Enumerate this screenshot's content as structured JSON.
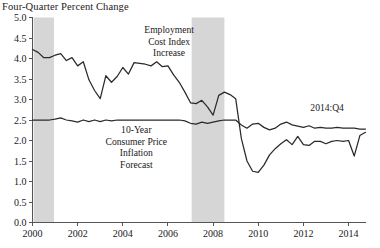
{
  "chart_data": {
    "type": "line",
    "title": "Four-Quarter Percent Change",
    "xlabel": "",
    "ylabel": "",
    "xlim": [
      2000.0,
      2014.75
    ],
    "ylim": [
      0.0,
      5.0
    ],
    "grid": false,
    "legend_position": "inline-annotations",
    "y_ticks": [
      "0.0",
      "0.5",
      "1.0",
      "1.5",
      "2.0",
      "2.5",
      "3.0",
      "3.5",
      "4.0",
      "4.5",
      "5.0"
    ],
    "y_tick_values": [
      0.0,
      0.5,
      1.0,
      1.5,
      2.0,
      2.5,
      3.0,
      3.5,
      4.0,
      4.5,
      5.0
    ],
    "x_ticks": [
      "2000",
      "2002",
      "2004",
      "2006",
      "2008",
      "2010",
      "2012",
      "2014"
    ],
    "x_tick_values": [
      2000,
      2002,
      2004,
      2006,
      2008,
      2010,
      2012,
      2014
    ],
    "annotations": [
      {
        "name": "eci-label",
        "lines": [
          "Employment",
          "Cost Index",
          "Increase"
        ],
        "x": 2006.05,
        "y": 4.62
      },
      {
        "name": "cpi-label",
        "lines": [
          "10-Year",
          "Consumer Price",
          "Inflation",
          "Forecast"
        ],
        "x": 2004.6,
        "y": 2.18
      },
      {
        "name": "endpoint-label",
        "lines": [
          "2014:Q4"
        ],
        "x": 2013.05,
        "y": 2.72
      }
    ],
    "shaded_regions": [
      {
        "name": "recession-2001",
        "x0": 2000.05,
        "x1": 2000.95,
        "color": "#d6d6d6"
      },
      {
        "name": "recession-2008",
        "x0": 2007.05,
        "x1": 2008.5,
        "color": "#d6d6d6"
      }
    ],
    "series": [
      {
        "name": "Employment Cost Index Increase",
        "color": "#2a2a2a",
        "x": [
          2000.0,
          2000.25,
          2000.5,
          2000.75,
          2001.0,
          2001.25,
          2001.5,
          2001.75,
          2002.0,
          2002.25,
          2002.5,
          2002.75,
          2003.0,
          2003.25,
          2003.5,
          2003.75,
          2004.0,
          2004.25,
          2004.5,
          2004.75,
          2005.0,
          2005.25,
          2005.5,
          2005.75,
          2006.0,
          2006.25,
          2006.5,
          2006.75,
          2007.0,
          2007.25,
          2007.5,
          2007.75,
          2008.0,
          2008.25,
          2008.5,
          2008.75,
          2009.0,
          2009.25,
          2009.5,
          2009.75,
          2010.0,
          2010.25,
          2010.5,
          2010.75,
          2011.0,
          2011.25,
          2011.5,
          2011.75,
          2012.0,
          2012.25,
          2012.5,
          2012.75,
          2013.0,
          2013.25,
          2013.5,
          2013.75,
          2014.0,
          2014.25,
          2014.5,
          2014.75
        ],
        "values": [
          4.22,
          4.15,
          4.02,
          4.02,
          4.08,
          4.12,
          3.95,
          4.02,
          3.82,
          3.92,
          3.48,
          3.22,
          3.02,
          3.58,
          3.42,
          3.56,
          3.78,
          3.62,
          3.9,
          3.88,
          3.86,
          3.82,
          3.92,
          3.8,
          3.82,
          3.6,
          3.42,
          3.18,
          2.92,
          2.9,
          2.98,
          2.82,
          2.62,
          3.1,
          3.18,
          3.12,
          3.02,
          2.05,
          1.5,
          1.25,
          1.22,
          1.4,
          1.65,
          1.8,
          1.92,
          2.02,
          1.9,
          2.1,
          1.9,
          1.88,
          1.98,
          1.98,
          1.92,
          1.98,
          2.0,
          1.98,
          2.0,
          1.62,
          2.12,
          2.2
        ]
      },
      {
        "name": "10-Year Consumer Price Inflation Forecast",
        "color": "#2a2a2a",
        "x": [
          2000.0,
          2000.25,
          2000.5,
          2000.75,
          2001.0,
          2001.25,
          2001.5,
          2001.75,
          2002.0,
          2002.25,
          2002.5,
          2002.75,
          2003.0,
          2003.25,
          2003.5,
          2003.75,
          2004.0,
          2004.25,
          2004.5,
          2004.75,
          2005.0,
          2005.25,
          2005.5,
          2005.75,
          2006.0,
          2006.25,
          2006.5,
          2006.75,
          2007.0,
          2007.25,
          2007.5,
          2007.75,
          2008.0,
          2008.25,
          2008.5,
          2008.75,
          2009.0,
          2009.25,
          2009.5,
          2009.75,
          2010.0,
          2010.25,
          2010.5,
          2010.75,
          2011.0,
          2011.25,
          2011.5,
          2011.75,
          2012.0,
          2012.25,
          2012.5,
          2012.75,
          2013.0,
          2013.25,
          2013.5,
          2013.75,
          2014.0,
          2014.25,
          2014.5,
          2014.75
        ],
        "values": [
          2.5,
          2.5,
          2.5,
          2.5,
          2.52,
          2.55,
          2.5,
          2.48,
          2.45,
          2.5,
          2.46,
          2.5,
          2.46,
          2.5,
          2.48,
          2.5,
          2.5,
          2.5,
          2.5,
          2.5,
          2.5,
          2.5,
          2.5,
          2.5,
          2.5,
          2.5,
          2.5,
          2.48,
          2.42,
          2.4,
          2.45,
          2.42,
          2.45,
          2.48,
          2.5,
          2.5,
          2.5,
          2.38,
          2.3,
          2.4,
          2.42,
          2.32,
          2.26,
          2.3,
          2.4,
          2.45,
          2.38,
          2.35,
          2.32,
          2.36,
          2.3,
          2.32,
          2.3,
          2.3,
          2.32,
          2.3,
          2.3,
          2.3,
          2.28,
          2.28
        ]
      }
    ]
  }
}
